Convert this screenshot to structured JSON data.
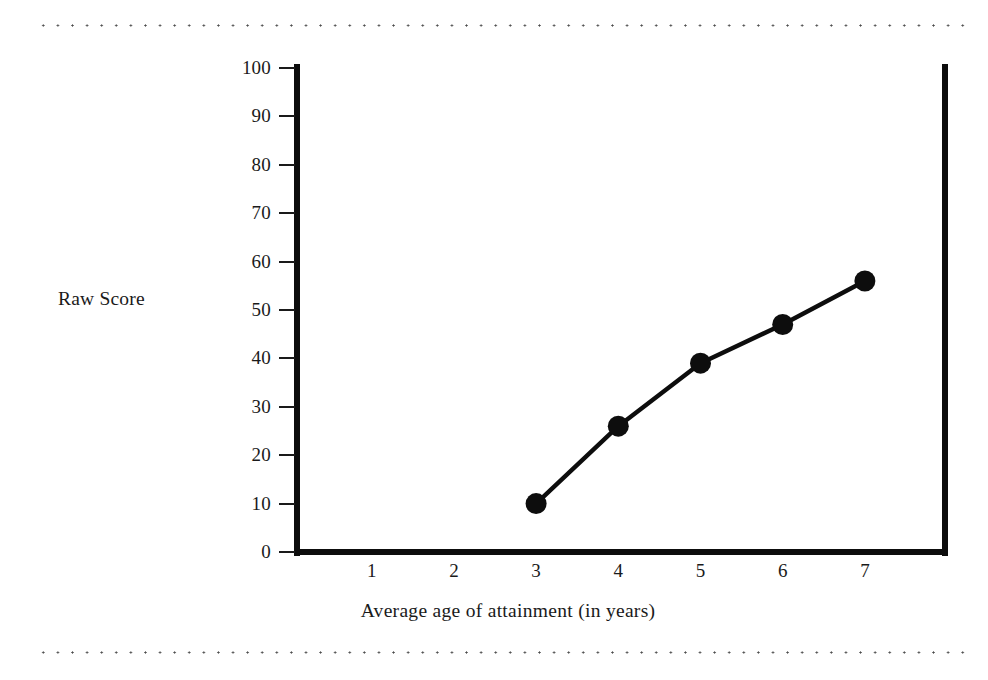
{
  "figure": {
    "ylabel": "Raw Score",
    "xlabel": "Average age of attainment (in years)",
    "decoration": {
      "top_rule": "dotted-rule",
      "bottom_rule": "dotted-rule"
    }
  },
  "chart_data": {
    "type": "line",
    "title": "",
    "xlabel": "Average age of attainment (in years)",
    "ylabel": "Raw Score",
    "x": [
      3,
      4,
      5,
      6,
      7
    ],
    "values": [
      10,
      26,
      39,
      47,
      56
    ],
    "series": [
      {
        "name": "Raw Score",
        "x": [
          3,
          4,
          5,
          6,
          7
        ],
        "values": [
          10,
          26,
          39,
          47,
          56
        ]
      }
    ],
    "xlim": [
      0,
      8
    ],
    "ylim": [
      0,
      100
    ],
    "xticks": [
      1,
      2,
      3,
      4,
      5,
      6,
      7
    ],
    "xtick_labels": [
      "1",
      "2",
      "3",
      "4",
      "5",
      "6",
      "7"
    ],
    "yticks": [
      0,
      10,
      20,
      30,
      40,
      50,
      60,
      70,
      80,
      90,
      100
    ],
    "ytick_labels": [
      "0",
      "10",
      "20",
      "30",
      "40",
      "50",
      "60",
      "70",
      "80",
      "90",
      "100"
    ],
    "grid": false,
    "legend": "none",
    "marker": "filled-circle",
    "line_color": "#0d0d0d",
    "marker_color": "#0d0d0d",
    "background": "#ffffff"
  }
}
